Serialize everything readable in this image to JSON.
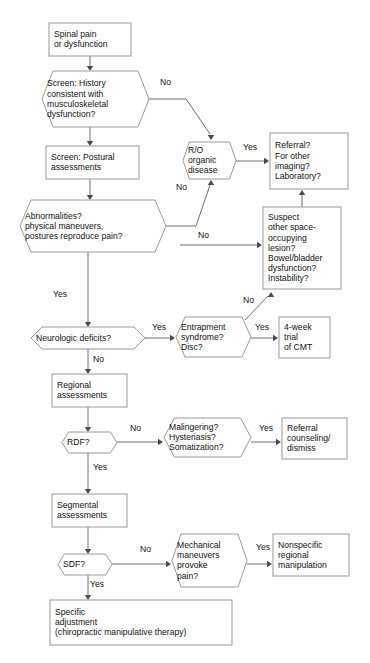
{
  "diagram": {
    "background_color": "#ffffff",
    "node_stroke_color": "#9a9a9a",
    "connector_color": "#6f6f6f",
    "text_color": "#111111",
    "nodes": [
      {
        "id": "spinal-pain",
        "shape": "box",
        "lines": [
          "Spinal pain",
          "or dysfunction"
        ],
        "x": 49,
        "y": 23,
        "w": 82,
        "h": 33
      },
      {
        "id": "screen-history",
        "shape": "hexagon",
        "lines": [
          "Screen: History",
          "consistent with",
          "musculoskeletal",
          "dysfunction?"
        ],
        "x": 42,
        "y": 71,
        "w": 107,
        "h": 56
      },
      {
        "id": "screen-postural",
        "shape": "box",
        "lines": [
          "Screen: Postural",
          "assessments"
        ],
        "x": 46,
        "y": 146,
        "w": 93,
        "h": 33
      },
      {
        "id": "abnormalities",
        "shape": "hexagon",
        "lines": [
          "Abnormalities?",
          "physical maneuvers,",
          "postures reproduce pain?"
        ],
        "x": 20,
        "y": 200,
        "w": 146,
        "h": 52
      },
      {
        "id": "ro-organic",
        "shape": "hexagon",
        "lines": [
          "R/O",
          "organic",
          "disease"
        ],
        "x": 183,
        "y": 142,
        "w": 53,
        "h": 37
      },
      {
        "id": "referral-imaging",
        "shape": "box",
        "lines": [
          "Referral?",
          "For other",
          "imaging?",
          "Laboratory?"
        ],
        "x": 270,
        "y": 133,
        "w": 78,
        "h": 56
      },
      {
        "id": "suspect-lesion",
        "shape": "box",
        "lines": [
          "Suspect",
          "other space-",
          "occupying",
          "lesion?",
          "Bowel/bladder",
          "dysfunction?",
          "Instability?"
        ],
        "x": 263,
        "y": 207,
        "w": 78,
        "h": 82
      },
      {
        "id": "neurologic-deficits",
        "shape": "hexagon",
        "lines": [
          "Neurologic deficits?"
        ],
        "x": 31,
        "y": 327,
        "w": 114,
        "h": 22
      },
      {
        "id": "entrapment",
        "shape": "hexagon",
        "lines": [
          "Entrapment",
          "syndrome?",
          "Disc?"
        ],
        "x": 176,
        "y": 317,
        "w": 75,
        "h": 40
      },
      {
        "id": "four-week-cmt",
        "shape": "box",
        "lines": [
          "4-week",
          "trial",
          "of CMT"
        ],
        "x": 279,
        "y": 317,
        "w": 51,
        "h": 41
      },
      {
        "id": "regional-assessments",
        "shape": "box",
        "lines": [
          "Regional",
          "assessments"
        ],
        "x": 52,
        "y": 374,
        "w": 75,
        "h": 33
      },
      {
        "id": "rdf",
        "shape": "hexagon",
        "lines": [
          "RDF?"
        ],
        "x": 62,
        "y": 432,
        "w": 55,
        "h": 21
      },
      {
        "id": "malingering",
        "shape": "hexagon",
        "lines": [
          "Malingering?",
          "Hysteriasis?",
          "Somatization?"
        ],
        "x": 164,
        "y": 418,
        "w": 87,
        "h": 39
      },
      {
        "id": "referral-counseling",
        "shape": "box",
        "lines": [
          "Referral",
          "counseling/",
          "dismiss"
        ],
        "x": 282,
        "y": 418,
        "w": 65,
        "h": 41
      },
      {
        "id": "segmental-assessments",
        "shape": "box",
        "lines": [
          "Segmental",
          "assessments"
        ],
        "x": 52,
        "y": 494,
        "w": 75,
        "h": 33
      },
      {
        "id": "sdf",
        "shape": "hexagon",
        "lines": [
          "SDF?"
        ],
        "x": 58,
        "y": 554,
        "w": 54,
        "h": 21
      },
      {
        "id": "mechanical-maneuvers",
        "shape": "hexagon",
        "lines": [
          "Mechanical",
          "maneuvers",
          "provoke",
          "pain?"
        ],
        "x": 172,
        "y": 534,
        "w": 75,
        "h": 53
      },
      {
        "id": "nonspecific-manipulation",
        "shape": "box",
        "lines": [
          "Nonspecific",
          "regional",
          "manipulation"
        ],
        "x": 273,
        "y": 534,
        "w": 76,
        "h": 42
      },
      {
        "id": "specific-adjustment",
        "shape": "box",
        "lines": [
          "Specific",
          "adjustment",
          "(chiropractic manipulative therapy)"
        ],
        "x": 50,
        "y": 600,
        "w": 182,
        "h": 45
      }
    ],
    "edge_labels": [
      {
        "id": "history-no",
        "text": "No",
        "x": 160,
        "y": 85
      },
      {
        "id": "ro-yes",
        "text": "Yes",
        "x": 243,
        "y": 150
      },
      {
        "id": "abnormalities-no",
        "text": "No",
        "x": 176,
        "y": 190
      },
      {
        "id": "suspect-no",
        "text": "No",
        "x": 198,
        "y": 238
      },
      {
        "id": "abnormalities-yes",
        "text": "Yes",
        "x": 53,
        "y": 297
      },
      {
        "id": "neuro-yes",
        "text": "Yes",
        "x": 152,
        "y": 330
      },
      {
        "id": "entrapment-yes",
        "text": "Yes",
        "x": 255,
        "y": 330
      },
      {
        "id": "entrapment-no",
        "text": "No",
        "x": 243,
        "y": 303
      },
      {
        "id": "neuro-no",
        "text": "No",
        "x": 93,
        "y": 362
      },
      {
        "id": "rdf-no",
        "text": "No",
        "x": 130,
        "y": 431
      },
      {
        "id": "malingering-yes",
        "text": "Yes",
        "x": 259,
        "y": 431
      },
      {
        "id": "rdf-yes",
        "text": "Yes",
        "x": 93,
        "y": 470
      },
      {
        "id": "sdf-no",
        "text": "No",
        "x": 140,
        "y": 552
      },
      {
        "id": "mech-yes",
        "text": "Yes",
        "x": 256,
        "y": 550
      },
      {
        "id": "sdf-yes",
        "text": "Yes",
        "x": 90,
        "y": 587
      }
    ],
    "connectors": [
      {
        "id": "spinal-to-screen",
        "path": "M 90,56 L 90,67",
        "arrow": "down",
        "ax": 90,
        "ay": 71
      },
      {
        "id": "screen-to-postural",
        "path": "M 90,127 L 90,142",
        "arrow": "down",
        "ax": 90,
        "ay": 146
      },
      {
        "id": "postural-to-abnorm",
        "path": "M 90,179 L 90,196",
        "arrow": "down",
        "ax": 90,
        "ay": 200
      },
      {
        "id": "history-no-to-ro",
        "path": "M 149,99 L 186,99 L 210,134",
        "arrow": "down",
        "ax": 211,
        "ay": 140
      },
      {
        "id": "ro-to-referral",
        "path": "M 236,161 L 264,161",
        "arrow": "right",
        "ax": 269,
        "ay": 161
      },
      {
        "id": "abnorm-no-to-ro",
        "path": "M 166,226 L 196,226 L 210,185",
        "arrow": "up",
        "ax": 211,
        "ay": 180
      },
      {
        "id": "suspect-to-referral",
        "path": "M 302,207 L 302,195",
        "arrow": "up",
        "ax": 302,
        "ay": 190
      },
      {
        "id": "ro-no-to-suspect",
        "path": "M 180,245 L 257,245",
        "arrow": "right",
        "ax": 262,
        "ay": 245
      },
      {
        "id": "abnorm-yes-to-neuro",
        "path": "M 88,252 L 88,323",
        "arrow": "down",
        "ax": 88,
        "ay": 327
      },
      {
        "id": "neuro-yes-to-entrap",
        "path": "M 145,338 L 170,338",
        "arrow": "right",
        "ax": 175,
        "ay": 338
      },
      {
        "id": "entrap-yes-to-cmt",
        "path": "M 251,338 L 273,338",
        "arrow": "right",
        "ax": 278,
        "ay": 338
      },
      {
        "id": "entrap-no-to-suspect",
        "path": "M 245,320 L 268,296",
        "arrow": "up",
        "ax": 271,
        "ay": 292
      },
      {
        "id": "neuro-no-to-regional",
        "path": "M 88,349 L 88,370",
        "arrow": "down",
        "ax": 88,
        "ay": 374
      },
      {
        "id": "regional-to-rdf",
        "path": "M 88,407 L 88,428",
        "arrow": "down",
        "ax": 88,
        "ay": 432
      },
      {
        "id": "rdf-no-to-maling",
        "path": "M 117,442 L 158,442",
        "arrow": "right",
        "ax": 163,
        "ay": 442
      },
      {
        "id": "maling-yes-to-referral",
        "path": "M 251,442 L 276,442",
        "arrow": "right",
        "ax": 281,
        "ay": 442
      },
      {
        "id": "rdf-yes-to-segmental",
        "path": "M 88,453 L 88,490",
        "arrow": "down",
        "ax": 88,
        "ay": 494
      },
      {
        "id": "segmental-to-sdf",
        "path": "M 88,527 L 88,550",
        "arrow": "down",
        "ax": 88,
        "ay": 554
      },
      {
        "id": "sdf-no-to-mech",
        "path": "M 112,564 L 166,564",
        "arrow": "right",
        "ax": 171,
        "ay": 564
      },
      {
        "id": "mech-yes-to-nonspecific",
        "path": "M 247,564 L 267,564",
        "arrow": "right",
        "ax": 272,
        "ay": 564
      },
      {
        "id": "sdf-yes-to-specific",
        "path": "M 88,575 L 88,596",
        "arrow": "down",
        "ax": 88,
        "ay": 600
      }
    ]
  }
}
